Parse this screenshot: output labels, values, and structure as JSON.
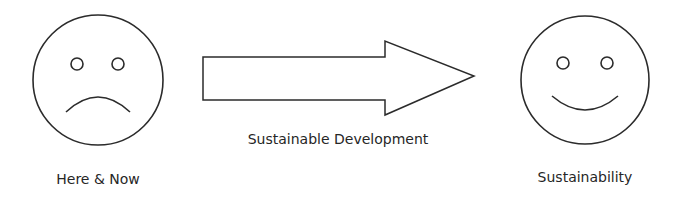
{
  "diagram": {
    "left": {
      "label": "Here & Now",
      "expression": "sad"
    },
    "arrow": {
      "label": "Sustainable Development"
    },
    "right": {
      "label": "Sustainability",
      "expression": "happy"
    },
    "stroke_color": "#2b2b2b"
  }
}
